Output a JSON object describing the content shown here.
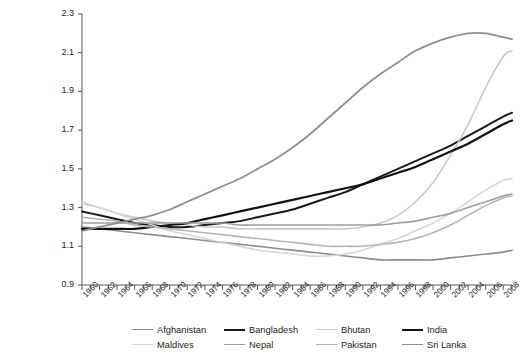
{
  "chart_data": {
    "type": "line",
    "title": "",
    "xlabel": "",
    "ylabel": "ratio of working-age population to\nnonworking-age population",
    "xlim": [
      1960,
      2009
    ],
    "ylim": [
      0.9,
      2.3
    ],
    "yticks": [
      "0.9",
      "1.1",
      "1.3",
      "1.5",
      "1.7",
      "1.9",
      "2.1",
      "2.3"
    ],
    "ytick_values": [
      0.9,
      1.1,
      1.3,
      1.5,
      1.7,
      1.9,
      2.1,
      2.3
    ],
    "xticks": [
      "1960",
      "1962",
      "1964",
      "1966",
      "1968",
      "1970",
      "1972",
      "1974",
      "1976",
      "1978",
      "1980",
      "1982",
      "1984",
      "1986",
      "1988",
      "1990",
      "1992",
      "1994",
      "1996",
      "1998",
      "2000",
      "2002",
      "2004",
      "2006",
      "2008"
    ],
    "xtick_values": [
      1960,
      1962,
      1964,
      1966,
      1968,
      1970,
      1972,
      1974,
      1976,
      1978,
      1980,
      1982,
      1984,
      1986,
      1988,
      1990,
      1992,
      1994,
      1996,
      1998,
      2000,
      2002,
      2004,
      2006,
      2008
    ],
    "minor_xticks_every": 1,
    "grid": false,
    "legend_position": "bottom",
    "x": [
      1960,
      1962,
      1964,
      1966,
      1968,
      1970,
      1972,
      1974,
      1976,
      1978,
      1980,
      1982,
      1984,
      1986,
      1988,
      1990,
      1992,
      1994,
      1996,
      1998,
      2000,
      2002,
      2004,
      2006,
      2008,
      2009
    ],
    "series": [
      {
        "name": "Afghanistan",
        "color": "#8c8c8c",
        "width": 1.6,
        "values": [
          1.2,
          1.19,
          1.18,
          1.17,
          1.16,
          1.15,
          1.14,
          1.13,
          1.12,
          1.11,
          1.1,
          1.09,
          1.08,
          1.07,
          1.06,
          1.05,
          1.04,
          1.03,
          1.03,
          1.03,
          1.03,
          1.04,
          1.05,
          1.06,
          1.07,
          1.08
        ]
      },
      {
        "name": "Bangladesh",
        "color": "#1a1a1a",
        "width": 2.0,
        "values": [
          1.28,
          1.26,
          1.24,
          1.22,
          1.21,
          1.2,
          1.2,
          1.21,
          1.22,
          1.23,
          1.25,
          1.27,
          1.29,
          1.32,
          1.35,
          1.38,
          1.42,
          1.46,
          1.5,
          1.54,
          1.58,
          1.62,
          1.67,
          1.72,
          1.77,
          1.79
        ]
      },
      {
        "name": "Bhutan",
        "color": "#c9c9c9",
        "width": 1.6,
        "values": [
          1.32,
          1.3,
          1.27,
          1.25,
          1.23,
          1.22,
          1.21,
          1.2,
          1.2,
          1.19,
          1.19,
          1.19,
          1.19,
          1.19,
          1.19,
          1.19,
          1.2,
          1.22,
          1.26,
          1.33,
          1.43,
          1.57,
          1.73,
          1.92,
          2.08,
          2.11
        ]
      },
      {
        "name": "India",
        "color": "#111111",
        "width": 2.2,
        "values": [
          1.19,
          1.19,
          1.19,
          1.19,
          1.2,
          1.21,
          1.22,
          1.24,
          1.26,
          1.28,
          1.3,
          1.32,
          1.34,
          1.36,
          1.38,
          1.4,
          1.42,
          1.45,
          1.48,
          1.51,
          1.55,
          1.59,
          1.63,
          1.68,
          1.73,
          1.75
        ]
      },
      {
        "name": "Maldives",
        "color": "#d6d6d6",
        "width": 1.6,
        "values": [
          1.33,
          1.3,
          1.27,
          1.24,
          1.21,
          1.18,
          1.16,
          1.14,
          1.12,
          1.1,
          1.08,
          1.07,
          1.06,
          1.05,
          1.05,
          1.06,
          1.08,
          1.11,
          1.14,
          1.18,
          1.22,
          1.27,
          1.33,
          1.39,
          1.44,
          1.45
        ]
      },
      {
        "name": "Nepal",
        "color": "#9e9e9e",
        "width": 1.6,
        "values": [
          1.22,
          1.22,
          1.22,
          1.22,
          1.22,
          1.22,
          1.22,
          1.22,
          1.22,
          1.21,
          1.21,
          1.21,
          1.21,
          1.21,
          1.21,
          1.21,
          1.21,
          1.21,
          1.22,
          1.23,
          1.25,
          1.27,
          1.3,
          1.33,
          1.36,
          1.37
        ]
      },
      {
        "name": "Pakistan",
        "color": "#b5b5b5",
        "width": 1.6,
        "values": [
          1.25,
          1.24,
          1.23,
          1.21,
          1.2,
          1.19,
          1.18,
          1.17,
          1.16,
          1.15,
          1.14,
          1.13,
          1.12,
          1.11,
          1.1,
          1.1,
          1.1,
          1.11,
          1.12,
          1.14,
          1.17,
          1.21,
          1.26,
          1.31,
          1.35,
          1.36
        ]
      },
      {
        "name": "Sri Lanka",
        "color": "#8f8f8f",
        "width": 1.8,
        "values": [
          1.18,
          1.2,
          1.22,
          1.24,
          1.26,
          1.29,
          1.33,
          1.37,
          1.41,
          1.45,
          1.5,
          1.55,
          1.61,
          1.68,
          1.76,
          1.84,
          1.92,
          1.99,
          2.05,
          2.11,
          2.15,
          2.18,
          2.2,
          2.2,
          2.18,
          2.17
        ]
      }
    ]
  },
  "legend": {
    "items": [
      {
        "label": "Afghanistan",
        "color": "#8c8c8c",
        "width": 1.6
      },
      {
        "label": "Bangladesh",
        "color": "#1a1a1a",
        "width": 2.0
      },
      {
        "label": "Bhutan",
        "color": "#c9c9c9",
        "width": 1.6
      },
      {
        "label": "India",
        "color": "#111111",
        "width": 2.2
      },
      {
        "label": "Maldives",
        "color": "#d6d6d6",
        "width": 1.6
      },
      {
        "label": "Nepal",
        "color": "#9e9e9e",
        "width": 1.6
      },
      {
        "label": "Pakistan",
        "color": "#b5b5b5",
        "width": 1.6
      },
      {
        "label": "Sri Lanka",
        "color": "#8f8f8f",
        "width": 1.8
      }
    ]
  },
  "axes": {
    "axis_color": "#58595b",
    "background": "#ffffff"
  }
}
